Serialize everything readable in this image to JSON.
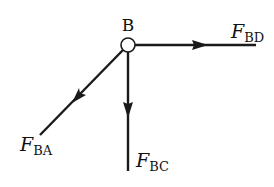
{
  "diagram": {
    "colors": {
      "stroke": "#1a1a1a",
      "background": "#ffffff",
      "node_fill": "#ffffff"
    },
    "node": {
      "label": "B",
      "cx": 128,
      "cy": 45,
      "r": 7
    },
    "forces": [
      {
        "id": "FBD",
        "symbol": "F",
        "subscript": "BD",
        "direction": "right",
        "from": [
          135,
          45
        ],
        "to": [
          256,
          45
        ],
        "arrow_at": [
          202,
          45
        ]
      },
      {
        "id": "FBC",
        "symbol": "F",
        "subscript": "BC",
        "direction": "down",
        "from": [
          128,
          52
        ],
        "to": [
          128,
          171
        ],
        "arrow_at": [
          128,
          112
        ]
      },
      {
        "id": "FBA",
        "symbol": "F",
        "subscript": "BA",
        "direction": "down-left",
        "from": [
          123,
          50
        ],
        "to": [
          40,
          135
        ],
        "arrow_at": [
          78,
          97
        ]
      }
    ],
    "labels": {
      "B": "B",
      "FBD_symbol": "F",
      "FBD_sub": "BD",
      "FBC_symbol": "F",
      "FBC_sub": "BC",
      "FBA_symbol": "F",
      "FBA_sub": "BA"
    }
  }
}
